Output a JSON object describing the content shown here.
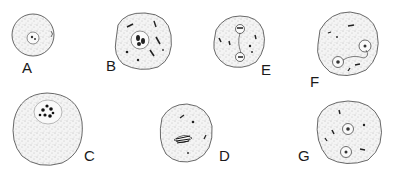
{
  "figure": {
    "panels": [
      {
        "label": "A",
        "cx": 33,
        "cy": 35,
        "rx": 21,
        "ry": 21,
        "label_x": 22,
        "label_y": 60
      },
      {
        "label": "B",
        "cx": 143,
        "cy": 41,
        "rx": 28,
        "ry": 29,
        "label_x": 106,
        "label_y": 58
      },
      {
        "label": "E",
        "cx": 240,
        "cy": 42,
        "rx": 26,
        "ry": 26,
        "label_x": 261,
        "label_y": 63
      },
      {
        "label": "F",
        "cx": 348,
        "cy": 42,
        "rx": 31,
        "ry": 33,
        "label_x": 311,
        "label_y": 75
      },
      {
        "label": "C",
        "cx": 47,
        "cy": 129,
        "rx": 35,
        "ry": 36,
        "label_x": 84,
        "label_y": 150
      },
      {
        "label": "D",
        "cx": 185,
        "cy": 134,
        "rx": 27,
        "ry": 28,
        "label_x": 219,
        "label_y": 150
      },
      {
        "label": "G",
        "cx": 349,
        "cy": 133,
        "rx": 34,
        "ry": 33,
        "label_x": 298,
        "label_y": 150
      }
    ]
  }
}
